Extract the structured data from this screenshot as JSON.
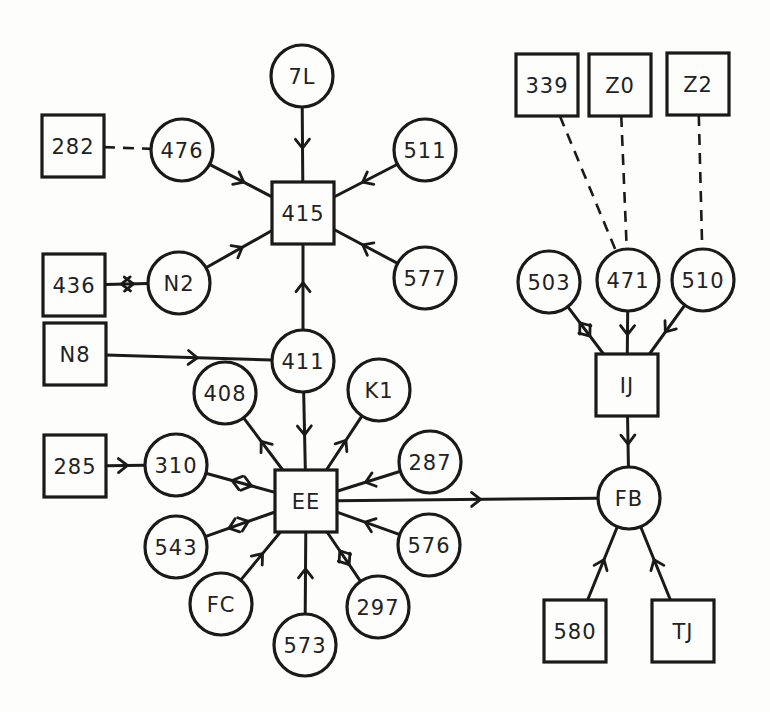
{
  "diagram": {
    "type": "directed-network",
    "node_kinds": {
      "square": "square box",
      "circle": "circle"
    },
    "colors": {
      "stroke": "#1a1a1a",
      "background": "#fdfdfb",
      "text": "#222222"
    },
    "nodes": [
      {
        "id": "7L",
        "label": "7L",
        "shape": "circle",
        "x": 302,
        "y": 76
      },
      {
        "id": "282",
        "label": "282",
        "shape": "square",
        "x": 73,
        "y": 146
      },
      {
        "id": "476",
        "label": "476",
        "shape": "circle",
        "x": 182,
        "y": 150
      },
      {
        "id": "511",
        "label": "511",
        "shape": "circle",
        "x": 425,
        "y": 150
      },
      {
        "id": "415",
        "label": "415",
        "shape": "square",
        "x": 303,
        "y": 213
      },
      {
        "id": "436",
        "label": "436",
        "shape": "square",
        "x": 74,
        "y": 285
      },
      {
        "id": "N2",
        "label": "N2",
        "shape": "circle",
        "x": 179,
        "y": 283
      },
      {
        "id": "577",
        "label": "577",
        "shape": "circle",
        "x": 425,
        "y": 278
      },
      {
        "id": "N8",
        "label": "N8",
        "shape": "square",
        "x": 75,
        "y": 354
      },
      {
        "id": "411",
        "label": "411",
        "shape": "circle",
        "x": 303,
        "y": 361
      },
      {
        "id": "408",
        "label": "408",
        "shape": "circle",
        "x": 225,
        "y": 393
      },
      {
        "id": "K1",
        "label": "K1",
        "shape": "circle",
        "x": 379,
        "y": 390
      },
      {
        "id": "285",
        "label": "285",
        "shape": "square",
        "x": 75,
        "y": 466
      },
      {
        "id": "310",
        "label": "310",
        "shape": "circle",
        "x": 176,
        "y": 465
      },
      {
        "id": "EE",
        "label": "EE",
        "shape": "square",
        "x": 306,
        "y": 501
      },
      {
        "id": "287",
        "label": "287",
        "shape": "circle",
        "x": 430,
        "y": 462
      },
      {
        "id": "543",
        "label": "543",
        "shape": "circle",
        "x": 176,
        "y": 547
      },
      {
        "id": "576",
        "label": "576",
        "shape": "circle",
        "x": 429,
        "y": 545
      },
      {
        "id": "FC",
        "label": "FC",
        "shape": "circle",
        "x": 221,
        "y": 604
      },
      {
        "id": "297",
        "label": "297",
        "shape": "circle",
        "x": 378,
        "y": 607
      },
      {
        "id": "573",
        "label": "573",
        "shape": "circle",
        "x": 305,
        "y": 645
      },
      {
        "id": "339",
        "label": "339",
        "shape": "square",
        "x": 547,
        "y": 85
      },
      {
        "id": "Z0",
        "label": "Z0",
        "shape": "square",
        "x": 620,
        "y": 85
      },
      {
        "id": "Z2",
        "label": "Z2",
        "shape": "square",
        "x": 698,
        "y": 84
      },
      {
        "id": "503",
        "label": "503",
        "shape": "circle",
        "x": 549,
        "y": 282
      },
      {
        "id": "471",
        "label": "471",
        "shape": "circle",
        "x": 628,
        "y": 280
      },
      {
        "id": "510",
        "label": "510",
        "shape": "circle",
        "x": 703,
        "y": 280
      },
      {
        "id": "IJ",
        "label": "IJ",
        "shape": "square",
        "x": 627,
        "y": 385
      },
      {
        "id": "FB",
        "label": "FB",
        "shape": "circle",
        "x": 629,
        "y": 498
      },
      {
        "id": "580",
        "label": "580",
        "shape": "square",
        "x": 575,
        "y": 631
      },
      {
        "id": "TJ",
        "label": "TJ",
        "shape": "square",
        "x": 683,
        "y": 631
      }
    ],
    "edges": [
      {
        "from": "7L",
        "to": "415",
        "style": "solid",
        "arrow": "forward"
      },
      {
        "from": "282",
        "to": "476",
        "style": "dashed",
        "arrow": "none"
      },
      {
        "from": "476",
        "to": "415",
        "style": "solid",
        "arrow": "forward"
      },
      {
        "from": "511",
        "to": "415",
        "style": "solid",
        "arrow": "forward"
      },
      {
        "from": "N2",
        "to": "415",
        "style": "solid",
        "arrow": "forward"
      },
      {
        "from": "577",
        "to": "415",
        "style": "solid",
        "arrow": "forward"
      },
      {
        "from": "436",
        "to": "N2",
        "style": "solid",
        "arrow": "both"
      },
      {
        "from": "411",
        "to": "415",
        "style": "solid",
        "arrow": "forward"
      },
      {
        "from": "N8",
        "to": "411",
        "style": "solid",
        "arrow": "forward"
      },
      {
        "from": "411",
        "to": "EE",
        "style": "solid",
        "arrow": "forward"
      },
      {
        "from": "EE",
        "to": "408",
        "style": "solid",
        "arrow": "forward"
      },
      {
        "from": "EE",
        "to": "K1",
        "style": "solid",
        "arrow": "forward"
      },
      {
        "from": "285",
        "to": "310",
        "style": "solid",
        "arrow": "forward"
      },
      {
        "from": "310",
        "to": "EE",
        "style": "solid",
        "arrow": "both"
      },
      {
        "from": "287",
        "to": "EE",
        "style": "solid",
        "arrow": "forward"
      },
      {
        "from": "EE",
        "to": "543",
        "style": "solid",
        "arrow": "both"
      },
      {
        "from": "576",
        "to": "EE",
        "style": "solid",
        "arrow": "forward"
      },
      {
        "from": "FC",
        "to": "EE",
        "style": "solid",
        "arrow": "forward"
      },
      {
        "from": "573",
        "to": "EE",
        "style": "solid",
        "arrow": "forward"
      },
      {
        "from": "EE",
        "to": "297",
        "style": "solid",
        "arrow": "both"
      },
      {
        "from": "EE",
        "to": "FB",
        "style": "solid",
        "arrow": "forward"
      },
      {
        "from": "339",
        "to": "471",
        "style": "dashed",
        "arrow": "none"
      },
      {
        "from": "Z0",
        "to": "471",
        "style": "dashed",
        "arrow": "none"
      },
      {
        "from": "Z2",
        "to": "510",
        "style": "dashed",
        "arrow": "none"
      },
      {
        "from": "IJ",
        "to": "503",
        "style": "solid",
        "arrow": "both"
      },
      {
        "from": "471",
        "to": "IJ",
        "style": "solid",
        "arrow": "forward"
      },
      {
        "from": "510",
        "to": "IJ",
        "style": "solid",
        "arrow": "forward"
      },
      {
        "from": "IJ",
        "to": "FB",
        "style": "solid",
        "arrow": "forward"
      },
      {
        "from": "580",
        "to": "FB",
        "style": "solid",
        "arrow": "forward"
      },
      {
        "from": "TJ",
        "to": "FB",
        "style": "solid",
        "arrow": "forward"
      }
    ]
  }
}
